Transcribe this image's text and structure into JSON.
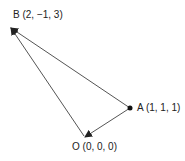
{
  "diagram": {
    "type": "vector-triangle",
    "points": {
      "B": {
        "label": "B (2, −1, 3)",
        "coords": [
          2,
          -1,
          3
        ]
      },
      "A": {
        "label": "A (1, 1, 1)",
        "coords": [
          1,
          1,
          1
        ]
      },
      "O": {
        "label": "O (0, 0, 0)",
        "coords": [
          0,
          0,
          0
        ]
      }
    },
    "vectors": [
      {
        "from": "A",
        "to": "B"
      },
      {
        "from": "A",
        "to": "O"
      },
      {
        "from": "O",
        "to": "B"
      }
    ],
    "colors": {
      "line": "#555555",
      "text": "#222222",
      "point": "#111111"
    }
  }
}
